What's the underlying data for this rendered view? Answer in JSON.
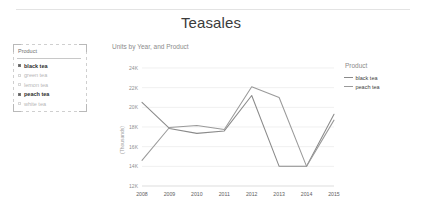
{
  "report": {
    "title": "Teasales"
  },
  "slicer": {
    "header": "Product",
    "items": [
      {
        "label": "black tea",
        "selected": true
      },
      {
        "label": "green tea",
        "selected": false
      },
      {
        "label": "lemon tea",
        "selected": false
      },
      {
        "label": "peach tea",
        "selected": true
      },
      {
        "label": "white tea",
        "selected": false
      }
    ]
  },
  "legend": {
    "title": "Product",
    "items": [
      {
        "label": "black tea",
        "color": "#8a8a8a"
      },
      {
        "label": "peach tea",
        "color": "#9a9a9a"
      }
    ]
  },
  "chart_data": {
    "type": "line",
    "title": "Teasales",
    "subtitle": "Units by Year, and Product",
    "xlabel": "",
    "ylabel": "(Thousands)",
    "x": [
      "2008",
      "2009",
      "2010",
      "2011",
      "2012",
      "2013",
      "2014",
      "2015"
    ],
    "xtick_labels": [
      "2008",
      "2009",
      "2010",
      "2011",
      "2012",
      "2013",
      "2014",
      "2015"
    ],
    "ytick_labels": [
      "24K",
      "22K",
      "20K",
      "18K",
      "16K",
      "14K",
      "12K"
    ],
    "ytick_values": [
      24000,
      22000,
      20000,
      18000,
      16000,
      14000,
      12000
    ],
    "ylim": [
      12000,
      24000
    ],
    "grid": true,
    "legend_position": "right",
    "series": [
      {
        "name": "black tea",
        "color": "#8a8a8a",
        "values": [
          20500,
          17850,
          17350,
          17600,
          21200,
          14000,
          14000,
          19300
        ]
      },
      {
        "name": "peach tea",
        "color": "#9a9a9a",
        "values": [
          14600,
          17950,
          18150,
          17750,
          22100,
          21000,
          14000,
          18700
        ]
      }
    ]
  }
}
